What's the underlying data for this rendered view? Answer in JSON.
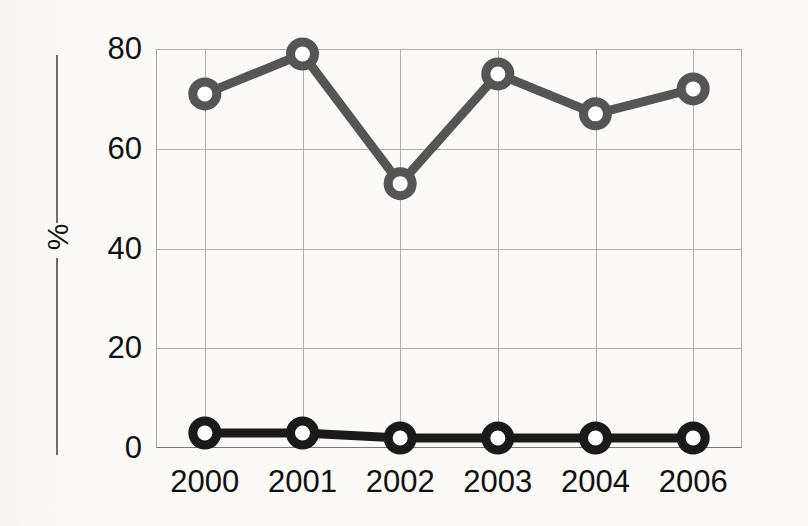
{
  "figure": {
    "ylabel": "%",
    "background_color": "#fbfaf7",
    "axis_rule_color": "#6d6d6d",
    "grid_color": "#b0b0b0"
  },
  "chart_data": {
    "type": "line",
    "title": "",
    "xlabel": "",
    "ylabel": "%",
    "categories": [
      "2000",
      "2001",
      "2002",
      "2003",
      "2004",
      "2006"
    ],
    "x_tick_labels": [
      "2000",
      "2001",
      "2002",
      "2003",
      "2004",
      "2006"
    ],
    "y_tick_labels": [
      "0",
      "20",
      "40",
      "60",
      "80"
    ],
    "y_ticks": [
      0,
      20,
      40,
      60,
      80
    ],
    "ylim": [
      0,
      80
    ],
    "grid": "both",
    "legend": "none",
    "marker": "circle-open",
    "series": [
      {
        "name": "upper-series",
        "color": "#555555",
        "values": [
          71,
          79,
          53,
          75,
          67,
          72
        ]
      },
      {
        "name": "lower-series",
        "color": "#1a1a1a",
        "values": [
          3,
          3,
          2,
          2,
          2,
          2
        ]
      }
    ]
  }
}
